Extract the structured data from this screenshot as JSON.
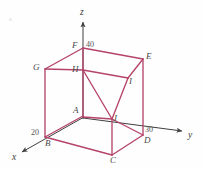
{
  "figure": {
    "type": "3d-coordinate-diagram",
    "background_color": "#fefefe",
    "edge_color": "#b5436b",
    "axis_color": "#3f3f3f",
    "label_color": "#4a4a4a"
  },
  "axes": [
    {
      "name": "x",
      "label": "x",
      "tick_value": "20",
      "direction": "down-left"
    },
    {
      "name": "y",
      "label": "y",
      "tick_value": "30",
      "direction": "right"
    },
    {
      "name": "z",
      "label": "z",
      "tick_value": "40",
      "direction": "up"
    }
  ],
  "axis_labels": {
    "x": "x",
    "y": "y",
    "z": "z"
  },
  "tick_labels": {
    "x_tick": "20",
    "y_tick": "30",
    "z_tick": "40"
  },
  "vertices": [
    {
      "name": "A",
      "label": "A",
      "x": 83,
      "y": 116,
      "role": "origin"
    },
    {
      "name": "B",
      "label": "B",
      "x": 45,
      "y": 137,
      "role": "box-corner"
    },
    {
      "name": "C",
      "label": "C",
      "x": 112,
      "y": 155,
      "role": "box-corner"
    },
    {
      "name": "D",
      "label": "D",
      "x": 143,
      "y": 135,
      "role": "box-corner"
    },
    {
      "name": "E",
      "label": "E",
      "x": 143,
      "y": 59,
      "role": "box-corner"
    },
    {
      "name": "F",
      "label": "F",
      "x": 83,
      "y": 48,
      "role": "box-corner"
    },
    {
      "name": "G",
      "label": "G",
      "x": 45,
      "y": 69,
      "role": "box-corner"
    },
    {
      "name": "H",
      "label": "H",
      "x": 83,
      "y": 70,
      "role": "triangle-vertex"
    },
    {
      "name": "I",
      "label": "I",
      "x": 128,
      "y": 78,
      "role": "triangle-vertex"
    },
    {
      "name": "J",
      "label": "J",
      "x": 112,
      "y": 119,
      "role": "triangle-vertex"
    }
  ],
  "vertex_labels": {
    "A": "A",
    "B": "B",
    "C": "C",
    "D": "D",
    "E": "E",
    "F": "F",
    "G": "G",
    "H": "H",
    "I": "I",
    "J": "J"
  }
}
